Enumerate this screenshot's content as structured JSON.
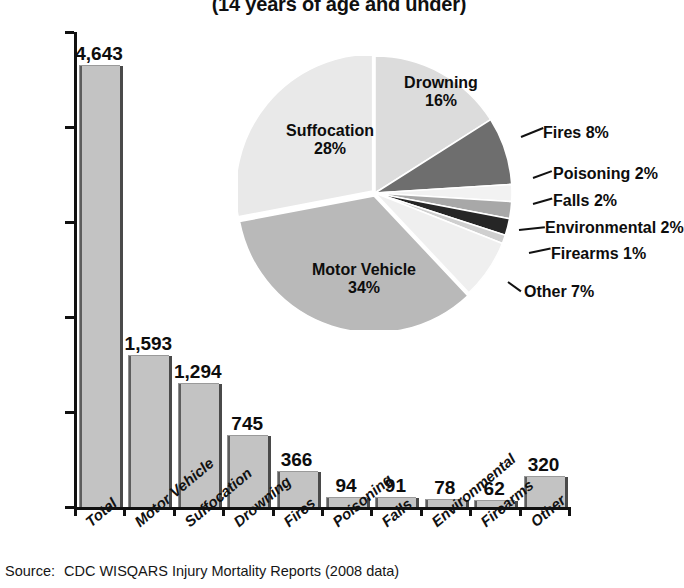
{
  "title": "(14 years of age and under)",
  "source": {
    "label": "Source:",
    "text": "CDC WISQARS Injury Mortality Reports (2008 data)"
  },
  "colors": {
    "bar_fill": "#c3c3c3",
    "bar_edge": "#4a4a4a",
    "axis": "#111111",
    "text": "#0d0d0d",
    "pie_suffocation": "#e9e9e9",
    "pie_motor_vehicle": "#b9b9b9",
    "pie_drowning": "#dcdcdc",
    "pie_fires": "#6e6e6e",
    "pie_poisoning": "#f2f2f2",
    "pie_falls": "#a8a8a8",
    "pie_environmental": "#262626",
    "pie_firearms": "#cfcfcf",
    "pie_other": "#efefef"
  },
  "chart_data": [
    {
      "type": "bar",
      "title": "(14 years of age and under)",
      "xlabel": "",
      "ylabel": "",
      "ylim": [
        0,
        5000
      ],
      "yticks": [
        0,
        1000,
        2000,
        3000,
        4000,
        5000
      ],
      "ytick_labels": [
        "0",
        "1000",
        "2000",
        "3000",
        "4000",
        "5000"
      ],
      "grid": false,
      "legend": "none",
      "categories": [
        "Total",
        "Motor Vehicle",
        "Suffocation",
        "Drowning",
        "Fires",
        "Poisoning",
        "Falls",
        "Environmental",
        "Firearms",
        "Other"
      ],
      "values": [
        4643,
        1593,
        1294,
        745,
        366,
        94,
        91,
        78,
        62,
        320
      ],
      "value_labels": [
        "4,643",
        "1,593",
        "1,294",
        "745",
        "366",
        "94",
        "91",
        "78",
        "62",
        "320"
      ]
    },
    {
      "type": "pie",
      "title": "",
      "legend": "callout-labels",
      "labels": [
        "Drowning",
        "Fires",
        "Poisoning",
        "Falls",
        "Environmental",
        "Firearms",
        "Other",
        "Motor Vehicle",
        "Suffocation"
      ],
      "values": [
        16,
        8,
        2,
        2,
        2,
        1,
        7,
        34,
        28
      ],
      "value_labels": [
        "16%",
        "8%",
        "2%",
        "2%",
        "2%",
        "1%",
        "7%",
        "34%",
        "28%"
      ],
      "slice_labels": [
        "Drowning 16%",
        "Fires 8%",
        "Poisoning 2%",
        "Falls 2%",
        "Environmental 2%",
        "Firearms 1%",
        "Other 7%",
        "Motor Vehicle 34%",
        "Suffocation 28%"
      ]
    }
  ],
  "bars": [
    {
      "cat": "Total",
      "value": 4643,
      "label": "4,643"
    },
    {
      "cat": "Motor Vehicle",
      "value": 1593,
      "label": "1,593"
    },
    {
      "cat": "Suffocation",
      "value": 1294,
      "label": "1,294"
    },
    {
      "cat": "Drowning",
      "value": 745,
      "label": "745"
    },
    {
      "cat": "Fires",
      "value": 366,
      "label": "366"
    },
    {
      "cat": "Poisoning",
      "value": 94,
      "label": "94"
    },
    {
      "cat": "Falls",
      "value": 91,
      "label": "91"
    },
    {
      "cat": "Environmental",
      "value": 78,
      "label": "78"
    },
    {
      "cat": "Firearms",
      "value": 62,
      "label": "62"
    },
    {
      "cat": "Other",
      "value": 320,
      "label": "320"
    }
  ],
  "yticks": [
    "5000",
    "4000",
    "3000",
    "2000",
    "1000",
    "0"
  ],
  "pie_labels": {
    "drowning_name": "Drowning",
    "drowning_pct": "16%",
    "suffocation_name": "Suffocation",
    "suffocation_pct": "28%",
    "motor_name": "Motor Vehicle",
    "motor_pct": "34%",
    "fires": "Fires 8%",
    "poisoning": "Poisoning 2%",
    "falls": "Falls 2%",
    "environmental": "Environmental 2%",
    "firearms": "Firearms 1%",
    "other": "Other 7%"
  }
}
